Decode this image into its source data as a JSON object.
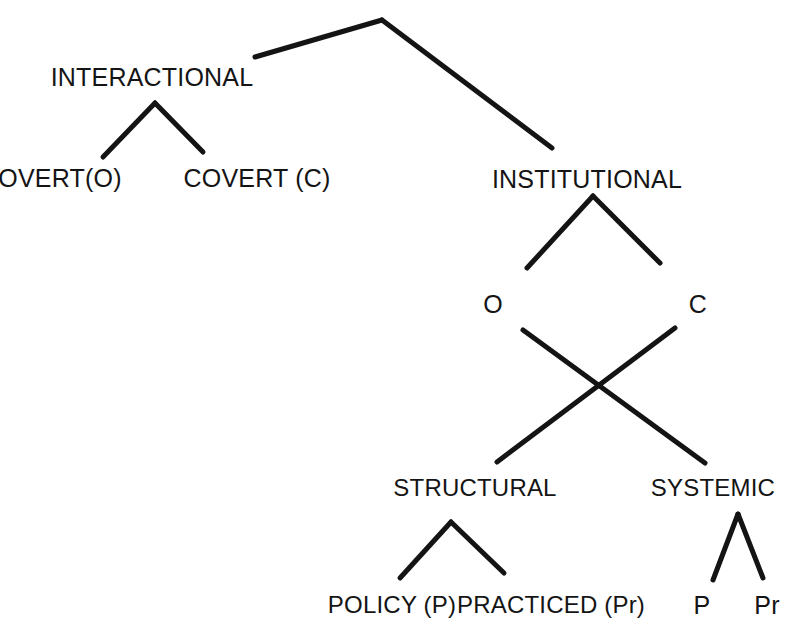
{
  "diagram": {
    "type": "hierarchical-tree",
    "title": "",
    "background_color": "#ffffff",
    "line_color": "#141414",
    "text_color": "#141414",
    "nodes": [
      {
        "id": "root",
        "label": "",
        "x": 382,
        "y": 20,
        "level": 0
      },
      {
        "id": "interactional",
        "label": "INTERACTIONAL",
        "x": 152,
        "y": 84,
        "level": 1
      },
      {
        "id": "institutional",
        "label": "INSTITUTIONAL",
        "x": 587,
        "y": 186,
        "level": 1
      },
      {
        "id": "overt-o",
        "label": "OVERT(O)",
        "x": 60,
        "y": 185,
        "level": 2
      },
      {
        "id": "covert-c",
        "label": "COVERT (C)",
        "x": 257,
        "y": 185,
        "level": 2
      },
      {
        "id": "inst-o",
        "label": "O",
        "x": 493,
        "y": 311,
        "level": 2
      },
      {
        "id": "inst-c",
        "label": "C",
        "x": 698,
        "y": 311,
        "level": 2
      },
      {
        "id": "structural",
        "label": "STRUCTURAL",
        "x": 475,
        "y": 495,
        "level": 3
      },
      {
        "id": "systemic",
        "label": "SYSTEMIC",
        "x": 713,
        "y": 495,
        "level": 3
      },
      {
        "id": "policy-p",
        "label": "POLICY (P)",
        "x": 392,
        "y": 612,
        "level": 4
      },
      {
        "id": "practiced-pr",
        "label": "PRACTICED (Pr)",
        "x": 551,
        "y": 612,
        "level": 4
      },
      {
        "id": "systemic-p",
        "label": "P",
        "x": 702,
        "y": 612,
        "level": 4
      },
      {
        "id": "systemic-pr",
        "label": "Pr",
        "x": 767,
        "y": 612,
        "level": 4
      }
    ],
    "edges": [
      {
        "id": "root-to-interactional",
        "from": "root",
        "to": "interactional",
        "x1": 382,
        "y1": 20,
        "x2": 255,
        "y2": 57
      },
      {
        "id": "root-to-institutional",
        "from": "root",
        "to": "institutional",
        "x1": 382,
        "y1": 20,
        "x2": 552,
        "y2": 148
      },
      {
        "id": "interactional-to-overt",
        "from": "interactional",
        "to": "overt-o",
        "x1": 155,
        "y1": 103,
        "x2": 103,
        "y2": 157
      },
      {
        "id": "interactional-to-covert",
        "from": "interactional",
        "to": "covert-c",
        "x1": 155,
        "y1": 103,
        "x2": 203,
        "y2": 152
      },
      {
        "id": "institutional-to-o",
        "from": "institutional",
        "to": "inst-o",
        "x1": 593,
        "y1": 196,
        "x2": 527,
        "y2": 268
      },
      {
        "id": "institutional-to-c",
        "from": "institutional",
        "to": "inst-c",
        "x1": 593,
        "y1": 196,
        "x2": 660,
        "y2": 263
      },
      {
        "id": "o-to-systemic",
        "from": "inst-o",
        "to": "systemic",
        "x1": 523,
        "y1": 330,
        "x2": 705,
        "y2": 463
      },
      {
        "id": "c-to-structural",
        "from": "inst-c",
        "to": "structural",
        "x1": 675,
        "y1": 328,
        "x2": 497,
        "y2": 462
      },
      {
        "id": "structural-to-policy",
        "from": "structural",
        "to": "policy-p",
        "x1": 451,
        "y1": 522,
        "x2": 400,
        "y2": 578
      },
      {
        "id": "structural-to-practiced",
        "from": "structural",
        "to": "practiced-pr",
        "x1": 451,
        "y1": 522,
        "x2": 504,
        "y2": 573
      },
      {
        "id": "systemic-to-p",
        "from": "systemic",
        "to": "systemic-p",
        "x1": 738,
        "y1": 514,
        "x2": 713,
        "y2": 580
      },
      {
        "id": "systemic-to-pr",
        "from": "systemic",
        "to": "systemic-pr",
        "x1": 738,
        "y1": 514,
        "x2": 763,
        "y2": 578
      }
    ]
  }
}
